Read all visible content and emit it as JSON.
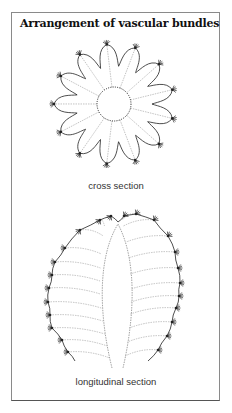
{
  "title": "Arrangement of vascular bundles",
  "diagrams": [
    {
      "id": "cross-section",
      "caption": "cross section",
      "spine_clusters": 13
    },
    {
      "id": "longitudinal-section",
      "caption": "longitudinal section"
    }
  ],
  "colors": {
    "outline": "#222222",
    "bundles": "#9a9a9a",
    "frame": "#8a8a8a"
  }
}
